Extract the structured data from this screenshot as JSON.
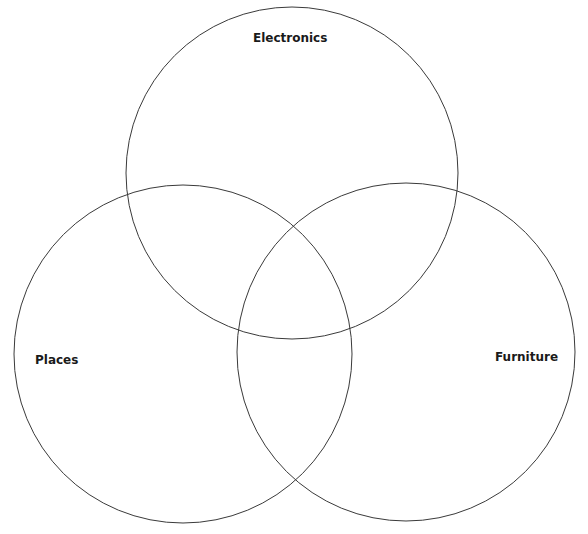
{
  "diagram": {
    "type": "venn",
    "sets": [
      {
        "label": "Electronics",
        "cx": 292,
        "cy": 173,
        "r": 166
      },
      {
        "label": "Places",
        "cx": 183,
        "cy": 354,
        "r": 169
      },
      {
        "label": "Furniture",
        "cx": 406,
        "cy": 352,
        "r": 169
      }
    ],
    "stroke_color": "#3a3a3a",
    "background": "#ffffff"
  }
}
